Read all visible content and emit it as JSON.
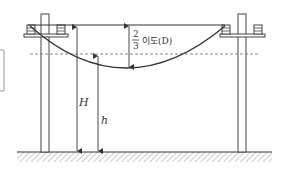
{
  "diagram": {
    "labels": {
      "fraction_numerator": "2",
      "fraction_denominator": "3",
      "sag_label": "이도(D)",
      "height_total": "H",
      "height_sag": "h"
    },
    "colors": {
      "line": "#333333",
      "dashed": "#777777",
      "hatch": "#888888",
      "background": "#ffffff"
    },
    "elements": [
      "left-pole",
      "right-pole",
      "left-crossarm",
      "right-crossarm",
      "insulators",
      "catenary-wire",
      "reference-line",
      "dashed-two-thirds-line",
      "H-arrow",
      "h-arrow",
      "D-arrow",
      "ground"
    ]
  }
}
